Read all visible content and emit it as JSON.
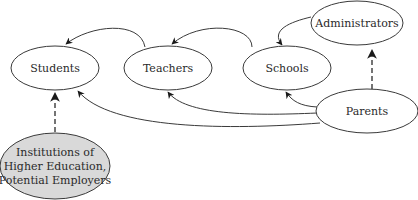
{
  "diagram": {
    "type": "directed-graph",
    "nodes": [
      {
        "id": "students",
        "label": "Students",
        "cx": 55,
        "cy": 68,
        "rx": 44,
        "ry": 22,
        "fill": "#ffffff"
      },
      {
        "id": "teachers",
        "label": "Teachers",
        "cx": 168,
        "cy": 68,
        "rx": 44,
        "ry": 22,
        "fill": "#ffffff"
      },
      {
        "id": "schools",
        "label": "Schools",
        "cx": 287,
        "cy": 68,
        "rx": 44,
        "ry": 22,
        "fill": "#ffffff"
      },
      {
        "id": "administrators",
        "label": "Administrators",
        "cx": 357,
        "cy": 23,
        "rx": 46,
        "ry": 22,
        "fill": "#ffffff"
      },
      {
        "id": "parents",
        "label": "Parents",
        "cx": 367,
        "cy": 111,
        "rx": 51,
        "ry": 22,
        "fill": "#ffffff"
      },
      {
        "id": "institutions",
        "label_lines": [
          "Institutions of",
          "Higher Education,",
          "Potential Employers"
        ],
        "cx": 55,
        "cy": 166,
        "rx": 55,
        "ry": 33,
        "fill": "#d9d9d9"
      }
    ],
    "edges": [
      {
        "from": "teachers",
        "to": "students",
        "style": "solid"
      },
      {
        "from": "schools",
        "to": "teachers",
        "style": "solid"
      },
      {
        "from": "administrators",
        "to": "schools",
        "style": "solid"
      },
      {
        "from": "parents",
        "to": "administrators",
        "style": "dashed"
      },
      {
        "from": "parents",
        "to": "schools",
        "style": "solid"
      },
      {
        "from": "parents",
        "to": "teachers",
        "style": "solid"
      },
      {
        "from": "parents",
        "to": "students",
        "style": "solid"
      },
      {
        "from": "institutions",
        "to": "students",
        "style": "dashed"
      }
    ]
  },
  "labels": {
    "students": "Students",
    "teachers": "Teachers",
    "schools": "Schools",
    "administrators": "Administrators",
    "parents": "Parents",
    "institutions_line1": "Institutions of",
    "institutions_line2": "Higher Education,",
    "institutions_line3": "Potential Employers"
  },
  "colors": {
    "stroke": "#3a3a3a",
    "institutions_fill": "#d9d9d9",
    "background": "#ffffff"
  }
}
